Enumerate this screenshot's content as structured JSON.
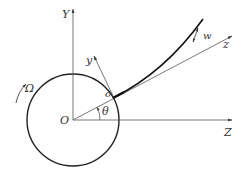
{
  "diagram": {
    "colors": {
      "stroke": "#222222",
      "thin": "#555555",
      "background": "#ffffff"
    },
    "labels": {
      "global_y_axis": "Y",
      "global_z_axis": "Z",
      "global_origin": "O",
      "local_origin": "o",
      "local_y_axis": "y",
      "local_z_axis": "z",
      "angle": "θ",
      "deflection": "w",
      "angular_velocity": "Ω"
    }
  }
}
